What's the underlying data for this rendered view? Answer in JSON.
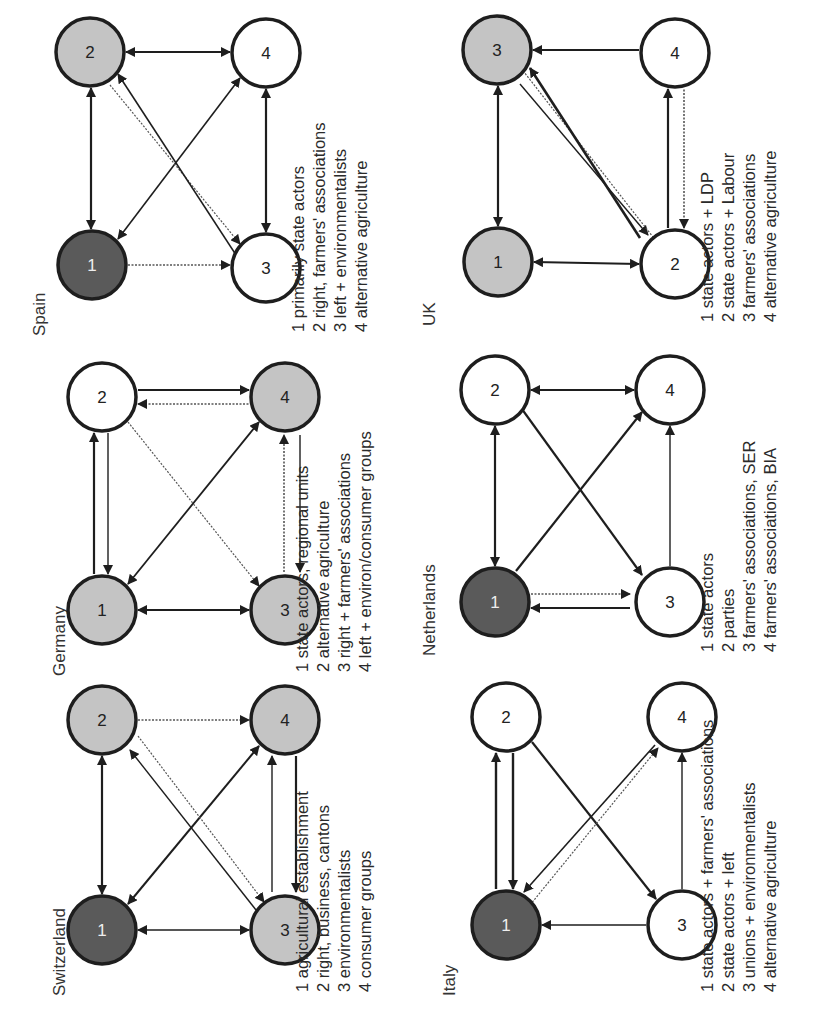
{
  "figure": {
    "panels": [
      {
        "id": "switzerland",
        "title": "Switzerland",
        "nodes": [
          {
            "id": "1",
            "label": "1",
            "fill": "dark"
          },
          {
            "id": "2",
            "label": "2",
            "fill": "light"
          },
          {
            "id": "3",
            "label": "3",
            "fill": "light"
          },
          {
            "id": "4",
            "label": "4",
            "fill": "light"
          }
        ],
        "legend": [
          "1 agricultural establishment",
          "2 right, business, cantons",
          "3 environmentalists",
          "4 consumer groups"
        ]
      },
      {
        "id": "germany",
        "title": "Germany",
        "nodes": [
          {
            "id": "1",
            "label": "1",
            "fill": "light"
          },
          {
            "id": "2",
            "label": "2",
            "fill": "white"
          },
          {
            "id": "3",
            "label": "3",
            "fill": "light"
          },
          {
            "id": "4",
            "label": "4",
            "fill": "light"
          }
        ],
        "legend": [
          "1 state actors, regional units",
          "2 alternative agriculture",
          "3 right + farmers' associations",
          "4 left + environ/consumer groups"
        ]
      },
      {
        "id": "spain",
        "title": "Spain",
        "nodes": [
          {
            "id": "1",
            "label": "1",
            "fill": "dark"
          },
          {
            "id": "2",
            "label": "2",
            "fill": "light"
          },
          {
            "id": "3",
            "label": "3",
            "fill": "white"
          },
          {
            "id": "4",
            "label": "4",
            "fill": "white"
          }
        ],
        "legend": [
          "1 primarily state actors",
          "2 right, farmers' associations",
          "3 left + environmentalists",
          "4 alternative agriculture"
        ]
      },
      {
        "id": "italy",
        "title": "Italy",
        "nodes": [
          {
            "id": "1",
            "label": "1",
            "fill": "dark"
          },
          {
            "id": "2",
            "label": "2",
            "fill": "white"
          },
          {
            "id": "3",
            "label": "3",
            "fill": "white"
          },
          {
            "id": "4",
            "label": "4",
            "fill": "white"
          }
        ],
        "legend": [
          "1 state actors + farmers' associations",
          "2 state actors + left",
          "3 unions + environmentalists",
          "4 alternative agriculture"
        ]
      },
      {
        "id": "netherlands",
        "title": "Netherlands",
        "nodes": [
          {
            "id": "1",
            "label": "1",
            "fill": "dark"
          },
          {
            "id": "2",
            "label": "2",
            "fill": "white"
          },
          {
            "id": "3",
            "label": "3",
            "fill": "white"
          },
          {
            "id": "4",
            "label": "4",
            "fill": "white"
          }
        ],
        "legend": [
          "1 state actors",
          "2 parties",
          "3 farmers' associations, SER",
          "4 farmers' associations, BIA"
        ]
      },
      {
        "id": "uk",
        "title": "UK",
        "nodes": [
          {
            "id": "1",
            "label": "1",
            "fill": "light"
          },
          {
            "id": "2",
            "label": "2",
            "fill": "white"
          },
          {
            "id": "3",
            "label": "3",
            "fill": "light"
          },
          {
            "id": "4",
            "label": "4",
            "fill": "white"
          }
        ],
        "legend": [
          "1 state actors + LDP",
          "2 state actors + Labour",
          "3 farmers' associations",
          "4 alternative agriculture"
        ]
      }
    ],
    "colors": {
      "dark": "#5a5a5a",
      "light": "#c4c4c4",
      "white": "#ffffff",
      "stroke": "#1e1e1e"
    },
    "orientation": "rotated 90 degrees counterclockwise"
  }
}
